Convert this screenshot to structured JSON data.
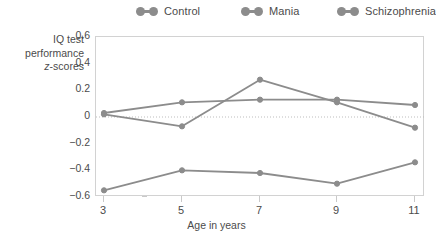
{
  "legend": {
    "items": [
      {
        "label": "Control",
        "marker": "dumbbell-marker",
        "color": "#8c8c8c"
      },
      {
        "label": "Mania",
        "marker": "dumbbell-marker",
        "color": "#8c8c8c"
      },
      {
        "label": "Schizophrenia",
        "marker": "dumbbell-marker",
        "color": "#8c8c8c"
      }
    ]
  },
  "axes": {
    "y_title_line1": "IQ test",
    "y_title_line2": "performance",
    "y_title_line3_italic": "z",
    "y_title_line3_rest": "-scores",
    "x_title": "Age in years",
    "y_ticks": [
      "0.6",
      "0.4",
      "0.2",
      "0",
      "−0.2",
      "−0.4",
      "−0.6"
    ],
    "x_ticks": [
      "3",
      "5",
      "7",
      "9",
      "11"
    ]
  },
  "chart_data": {
    "type": "line",
    "title": "",
    "subtitle": "",
    "xlabel": "Age in years",
    "ylabel": "IQ test performance z-scores",
    "x": [
      3,
      5,
      7,
      9,
      11
    ],
    "xlim": [
      3,
      11
    ],
    "ylim": [
      -0.6,
      0.6
    ],
    "ytick_values": [
      0.6,
      0.4,
      0.2,
      0,
      -0.2,
      -0.4,
      -0.6
    ],
    "grid": false,
    "zero_reference_line": true,
    "legend_position": "top",
    "series": [
      {
        "name": "Control",
        "color": "#8c8c8c",
        "values": [
          0.03,
          0.11,
          0.13,
          0.13,
          0.09
        ]
      },
      {
        "name": "Mania",
        "color": "#8c8c8c",
        "values": [
          0.02,
          -0.07,
          0.28,
          0.11,
          -0.08
        ]
      },
      {
        "name": "Schizophrenia",
        "color": "#8c8c8c",
        "values": [
          -0.55,
          -0.4,
          -0.42,
          -0.5,
          -0.34
        ]
      }
    ]
  }
}
